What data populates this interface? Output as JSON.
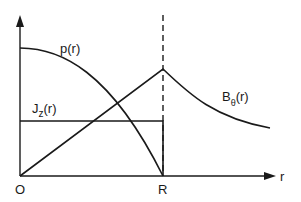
{
  "diagram": {
    "title": "",
    "axis": {
      "x_label": "r",
      "origin_label": "O",
      "R_label": "R"
    },
    "curves": [
      {
        "id": "pressure",
        "label_main": "p",
        "label_arg": "(r)",
        "shape": "parabolic decrease from max at r=0 to zero at r=R"
      },
      {
        "id": "current",
        "label_main": "J",
        "label_sub": "z",
        "label_arg": "(r)",
        "shape": "constant for r<R, drops to zero at r=R"
      },
      {
        "id": "field",
        "label_main": "B",
        "label_sub": "θ",
        "label_arg": "(r)",
        "shape": "linear increase to max at r=R, then ~1/r decay"
      }
    ],
    "colors": {
      "line": "#1a1a1a",
      "background": "#ffffff"
    }
  }
}
